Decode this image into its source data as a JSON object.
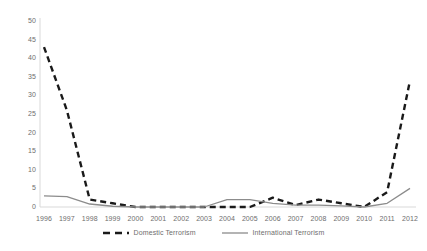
{
  "chart_data": {
    "type": "line",
    "title": "",
    "xlabel": "",
    "ylabel": "",
    "x": [
      1996,
      1997,
      1998,
      1999,
      2000,
      2001,
      2002,
      2003,
      2004,
      2005,
      2006,
      2007,
      2008,
      2009,
      2010,
      2011,
      2012
    ],
    "categories": [
      "1996",
      "1997",
      "1998",
      "1999",
      "2000",
      "2001",
      "2002",
      "2003",
      "2004",
      "2005",
      "2006",
      "2007",
      "2008",
      "2009",
      "2010",
      "2011",
      "2012"
    ],
    "series": [
      {
        "name": "Domestic Terrorism",
        "style": "dashed",
        "color": "#1a1a1a",
        "values": [
          43,
          26,
          2,
          1,
          0,
          0,
          0,
          0,
          0,
          0,
          2.5,
          0.5,
          2,
          1,
          0,
          4,
          34
        ]
      },
      {
        "name": "International Terrorism",
        "style": "solid",
        "color": "#8c8c8c",
        "values": [
          3,
          2.8,
          0.8,
          0.2,
          0,
          0,
          0,
          0,
          2,
          2,
          1,
          0.5,
          0.5,
          0.3,
          0,
          1,
          5
        ]
      }
    ],
    "ylim": [
      0,
      50
    ],
    "yticks": [
      0,
      5,
      10,
      15,
      20,
      25,
      30,
      35,
      40,
      45,
      50
    ],
    "ytick_labels": [
      "0",
      "5",
      "10",
      "15",
      "20",
      "25",
      "30",
      "35",
      "40",
      "45",
      "50"
    ],
    "xlim": [
      1996,
      2012
    ],
    "grid": false,
    "legend_position": "bottom"
  },
  "legend": {
    "entries": [
      {
        "label": "Domestic Terrorism",
        "style": "dashed",
        "color": "#1a1a1a"
      },
      {
        "label": "International Terrorism",
        "style": "solid",
        "color": "#8c8c8c"
      }
    ]
  },
  "axes": {
    "y_axis_line_color": "#d9d9d9",
    "x_axis_line_color": "#d9d9d9"
  }
}
